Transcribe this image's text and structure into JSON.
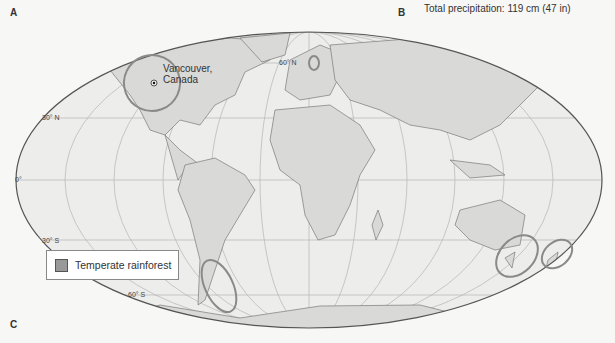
{
  "panels": {
    "a": "A",
    "b": "B",
    "c": "C"
  },
  "header": {
    "precipitation": "Total precipitation: 119 cm (47 in)"
  },
  "map": {
    "projection": "Mollweide world map",
    "city": {
      "name_line1": "Vancouver,",
      "name_line2": "Canada"
    },
    "latitudes": {
      "n60": "60° N",
      "n30": "30° N",
      "eq": "0°",
      "s30": "30° S",
      "s60": "60° S"
    },
    "highlighted_regions": [
      "Pacific Northwest",
      "Norway coast",
      "Southern Chile",
      "Tasmania/SE Australia",
      "New Zealand"
    ],
    "colors": {
      "ocean": "#ededec",
      "land": "#d9d9d8",
      "border": "#7a7a7a",
      "circle": "#8a8a8a",
      "outline": "#555555"
    }
  },
  "legend": {
    "label": "Temperate rainforest",
    "swatch_color": "#999999"
  }
}
